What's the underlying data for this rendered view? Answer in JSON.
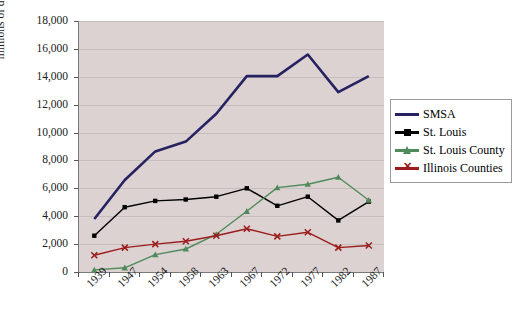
{
  "chart_data": {
    "type": "line",
    "title": "",
    "xlabel": "",
    "ylabel": "millions of dollars",
    "categories": [
      "1939",
      "1947",
      "1954",
      "1958",
      "1963",
      "1967",
      "1972",
      "1977",
      "1982",
      "1987"
    ],
    "ylim": [
      0,
      18000
    ],
    "ytick_labels": [
      "0",
      "2,000",
      "4,000",
      "6,000",
      "8,000",
      "10,000",
      "12,000",
      "14,000",
      "16,000",
      "18,000"
    ],
    "ytick_values": [
      0,
      2000,
      4000,
      6000,
      8000,
      10000,
      12000,
      14000,
      16000,
      18000
    ],
    "grid": true,
    "legend_position": "right",
    "plot_background": "#dcd2d2",
    "figure_background": "#ffffff",
    "series": [
      {
        "name": "SMSA",
        "color": "#262261",
        "marker": "none",
        "values": [
          3800,
          6600,
          8650,
          9350,
          11350,
          14050,
          14050,
          15600,
          12900,
          14050
        ]
      },
      {
        "name": "St. Louis",
        "color": "#000000",
        "marker": "square",
        "values": [
          2600,
          4650,
          5100,
          5200,
          5400,
          6000,
          4750,
          5400,
          3700,
          5050
        ]
      },
      {
        "name": "St. Louis County",
        "color": "#4f8a5b",
        "marker": "triangle",
        "values": [
          150,
          300,
          1250,
          1650,
          2700,
          4350,
          6050,
          6300,
          6800,
          5150
        ]
      },
      {
        "name": "Illinois Counties",
        "color": "#9b1c1c",
        "marker": "x",
        "values": [
          1200,
          1750,
          2000,
          2200,
          2600,
          3100,
          2550,
          2850,
          1750,
          1900
        ]
      }
    ]
  },
  "legend": {
    "items": [
      {
        "label": "SMSA"
      },
      {
        "label": "St. Louis"
      },
      {
        "label": "St. Louis County"
      },
      {
        "label": "Illinois Counties"
      }
    ]
  }
}
